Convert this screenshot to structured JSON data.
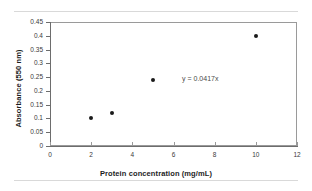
{
  "chart_data": {
    "type": "scatter",
    "title": "",
    "xlabel": "Protein concentration (mg/mL)",
    "ylabel": "Absorbance (550 nm)",
    "xlim": [
      0,
      12
    ],
    "ylim": [
      0,
      0.45
    ],
    "xticks": [
      "0",
      "2",
      "4",
      "6",
      "8",
      "10",
      "12"
    ],
    "yticks": [
      "0",
      "0.05",
      "0.1",
      "0.15",
      "0.2",
      "0.25",
      "0.3",
      "0.35",
      "0.4",
      "0.45"
    ],
    "xtick_values": [
      0,
      2,
      4,
      6,
      8,
      10,
      12
    ],
    "ytick_values": [
      0,
      0.05,
      0.1,
      0.15,
      0.2,
      0.25,
      0.3,
      0.35,
      0.4,
      0.45
    ],
    "grid": false,
    "legend": null,
    "series": [
      {
        "name": "Absorbance",
        "marker": "filled-diamond",
        "color": "#1a1a1a",
        "x": [
          2,
          3,
          5,
          10
        ],
        "y": [
          0.1,
          0.118,
          0.238,
          0.4
        ]
      }
    ],
    "annotations": [
      {
        "text": "y = 0.0417x",
        "x": 7.3,
        "y": 0.247
      }
    ]
  },
  "figure": {
    "equation_label": "y = 0.0417x",
    "axis_color": "#6d6d6d",
    "frame_color": "#9a9a9a",
    "marker_color": "#1a1a1a",
    "rule_color": "#d9d9d9"
  }
}
